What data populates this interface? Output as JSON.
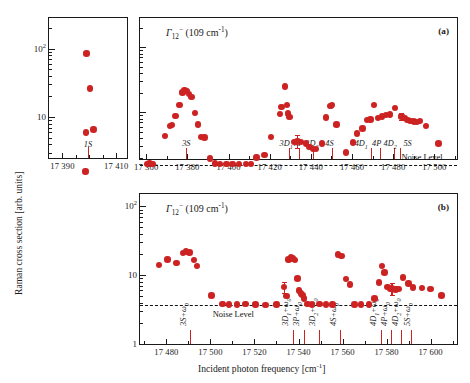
{
  "figure": {
    "y_axis_title": "Raman cross section  [arb. units]",
    "x_axis_title": "Incident photon frequency   [cm",
    "x_axis_title_sup": "-1",
    "x_axis_title_tail": "]",
    "noise_label": "Noise Level",
    "gamma_label_main": "Γ",
    "gamma_label_sub": "12",
    "gamma_label_sup": "−",
    "gamma_label_tail": " (109 cm",
    "gamma_label_tail_sup": "-1",
    "gamma_label_tail_end": ")"
  },
  "inset": {
    "name": "inset-1s-panel",
    "x_ticks_major": [
      17390,
      17410
    ],
    "x_ticks_major_labels": [
      "17 390",
      "17 410"
    ],
    "x_ticks_minor": [
      17395,
      17400,
      17405
    ],
    "xlim": [
      17385,
      17414
    ],
    "ylim_decades": [
      0.4,
      2.45
    ],
    "y_ticks_major": [
      1,
      10,
      100
    ],
    "y_ticks_major_labels": [
      "1",
      "10",
      "10"
    ],
    "y_tick_sup": "2",
    "state_label": "1S",
    "state_line_x": 17399.5,
    "points": [
      {
        "x": 17399.0,
        "y": 85.0
      },
      {
        "x": 17400.3,
        "y": 26.0
      },
      {
        "x": 17398.8,
        "y": 5.9
      },
      {
        "x": 17401.6,
        "y": 6.6
      },
      {
        "x": 17398.5,
        "y": 1.6
      }
    ]
  },
  "panel_a": {
    "name": "panel-a",
    "tag": "(a)",
    "xlim": [
      17357,
      17511
    ],
    "ylim_decades": [
      0.28,
      2.45
    ],
    "x_ticks_major": [
      17360,
      17380,
      17400,
      17420,
      17440,
      17460,
      17480,
      17500
    ],
    "x_ticks_major_labels": [
      "17 360",
      "17 380",
      "17 400",
      "17 420",
      "17 440",
      "17 460",
      "17 480",
      "17 500"
    ],
    "x_ticks_minor": [
      17370,
      17390,
      17410,
      17430,
      17450,
      17470,
      17490,
      17510
    ],
    "noise_level": 1.55,
    "state_labels": [
      {
        "text": "3S",
        "label_x": 17379.5,
        "line_x": 17379.5
      },
      {
        "text": "3D1",
        "base": "3D",
        "sub": "1",
        "label_x": 17428.0,
        "line_x": 17429.2
      },
      {
        "text": "3P",
        "base": "3P",
        "sub": "",
        "label_x": 17434.0,
        "line_x": 17434.3
      },
      {
        "text": "3D2",
        "base": "3D",
        "sub": "2",
        "label_x": 17440.5,
        "line_x": 17441.0
      },
      {
        "text": "4S",
        "base": "4S",
        "sub": "",
        "label_x": 17449.0,
        "line_x": 17450.5
      },
      {
        "text": "4D1",
        "base": "4D",
        "sub": "1",
        "label_x": 17464.5,
        "line_x": 17469.3
      },
      {
        "text": "4P",
        "base": "4P",
        "sub": "",
        "label_x": 17472.0,
        "line_x": 17473.5
      },
      {
        "text": "4D2",
        "base": "4D",
        "sub": "2",
        "label_x": 17478.5,
        "line_x": 17480.2
      },
      {
        "text": "5S",
        "base": "5S",
        "sub": "",
        "label_x": 17487.0,
        "line_x": 17483.5
      }
    ],
    "points": [
      {
        "x": 17360.3,
        "y": 1.6
      },
      {
        "x": 17361.6,
        "y": 1.62
      },
      {
        "x": 17363.0,
        "y": 1.6
      },
      {
        "x": 17369.2,
        "y": 4.3
      },
      {
        "x": 17371.5,
        "y": 6.1
      },
      {
        "x": 17372.6,
        "y": 6.3
      },
      {
        "x": 17374.2,
        "y": 8.8
      },
      {
        "x": 17376.2,
        "y": 13.0
      },
      {
        "x": 17377.6,
        "y": 20.0
      },
      {
        "x": 17378.7,
        "y": 21.5
      },
      {
        "x": 17379.8,
        "y": 21.0
      },
      {
        "x": 17380.9,
        "y": 19.0
      },
      {
        "x": 17382.0,
        "y": 17.0
      },
      {
        "x": 17383.6,
        "y": 9.8
      },
      {
        "x": 17385.2,
        "y": 6.5
      },
      {
        "x": 17386.6,
        "y": 4.2
      },
      {
        "x": 17388.3,
        "y": 4.1
      },
      {
        "x": 17391.0,
        "y": 1.95
      },
      {
        "x": 17393.5,
        "y": 1.62
      },
      {
        "x": 17396.0,
        "y": 1.58
      },
      {
        "x": 17399.0,
        "y": 1.6
      },
      {
        "x": 17402.0,
        "y": 1.6
      },
      {
        "x": 17405.0,
        "y": 1.6
      },
      {
        "x": 17408.5,
        "y": 1.58
      },
      {
        "x": 17411.0,
        "y": 1.6
      },
      {
        "x": 17413.5,
        "y": 2.0
      },
      {
        "x": 17417.5,
        "y": 2.2
      },
      {
        "x": 17420.5,
        "y": 4.2
      },
      {
        "x": 17425.0,
        "y": 9.3
      },
      {
        "x": 17425.8,
        "y": 12.0
      },
      {
        "x": 17427.3,
        "y": 25.0
      },
      {
        "x": 17428.3,
        "y": 13.0
      },
      {
        "x": 17428.9,
        "y": 9.5
      },
      {
        "x": 17429.7,
        "y": 8.4
      },
      {
        "x": 17432.0,
        "y": 3.5
      },
      {
        "x": 17433.5,
        "y": 3.55
      },
      {
        "x": 17435.2,
        "y": 3.5
      },
      {
        "x": 17437.5,
        "y": 3.3
      },
      {
        "x": 17439.3,
        "y": 2.9
      },
      {
        "x": 17441.0,
        "y": 2.7
      },
      {
        "x": 17442.6,
        "y": 2.7
      },
      {
        "x": 17445.5,
        "y": 3.3
      },
      {
        "x": 17447.5,
        "y": 8.3
      },
      {
        "x": 17449.5,
        "y": 12.5
      },
      {
        "x": 17450.4,
        "y": 13.0
      },
      {
        "x": 17452.5,
        "y": 6.5
      },
      {
        "x": 17457.0,
        "y": 2.4
      },
      {
        "x": 17460.5,
        "y": 3.4
      },
      {
        "x": 17462.5,
        "y": 4.7
      },
      {
        "x": 17465.0,
        "y": 5.6
      },
      {
        "x": 17467.3,
        "y": 7.6
      },
      {
        "x": 17469.0,
        "y": 7.7
      },
      {
        "x": 17470.8,
        "y": 13.0
      },
      {
        "x": 17472.5,
        "y": 8.2
      },
      {
        "x": 17474.5,
        "y": 8.6
      },
      {
        "x": 17476.5,
        "y": 9.0
      },
      {
        "x": 17478.5,
        "y": 9.2
      },
      {
        "x": 17481.0,
        "y": 11.5
      },
      {
        "x": 17484.0,
        "y": 8.6
      },
      {
        "x": 17485.5,
        "y": 8.2
      },
      {
        "x": 17487.0,
        "y": 7.6
      },
      {
        "x": 17488.5,
        "y": 7.3
      },
      {
        "x": 17490.0,
        "y": 7.2
      },
      {
        "x": 17491.5,
        "y": 7.1
      },
      {
        "x": 17493.0,
        "y": 7.3
      },
      {
        "x": 17496.0,
        "y": 6.1
      },
      {
        "x": 17502.0,
        "y": 3.3
      }
    ],
    "error_points": [
      {
        "x": 17433.5,
        "y": 3.55,
        "lo": 2.85,
        "hi": 4.45
      },
      {
        "x": 17484.0,
        "y": 8.6,
        "lo": 7.6,
        "hi": 9.8
      }
    ]
  },
  "panel_b": {
    "name": "panel-b",
    "tag": "(b)",
    "xlim": [
      17468,
      17612
    ],
    "ylim_decades": [
      0.0,
      2.18
    ],
    "x_ticks_major": [
      17480,
      17500,
      17520,
      17540,
      17560,
      17580,
      17600
    ],
    "x_ticks_major_labels": [
      "17 480",
      "17 500",
      "17 520",
      "17 540",
      "17 560",
      "17 580",
      "17 600"
    ],
    "x_ticks_minor": [
      17470,
      17490,
      17510,
      17530,
      17550,
      17570,
      17590,
      17610
    ],
    "y_ticks_major": [
      1,
      10,
      100
    ],
    "y_ticks_major_labels": [
      "1",
      "10",
      "10"
    ],
    "y_tick_sup": "2",
    "noise_level": 3.7,
    "state_labels": [
      {
        "base": "3S",
        "sub": "",
        "suffix": "+ω",
        "suffix_sub": "0",
        "label_x": 17490.0,
        "line_x": 17490.5
      },
      {
        "base": "3D",
        "sub": "1",
        "suffix": "+ω",
        "suffix_sub": "0",
        "label_x": 17536.0,
        "line_x": 17537.5
      },
      {
        "base": "3P",
        "sub": "",
        "suffix": "+ω",
        "suffix_sub": "0",
        "label_x": 17541.0,
        "line_x": 17542.5
      },
      {
        "base": "3D",
        "sub": "2",
        "suffix": "+ω",
        "suffix_sub": "0",
        "label_x": 17548.5,
        "line_x": 17549.5
      },
      {
        "base": "4S",
        "sub": "",
        "suffix": "+ω",
        "suffix_sub": "0",
        "label_x": 17558.0,
        "line_x": 17559.0
      },
      {
        "base": "4D",
        "sub": "1",
        "suffix": "+ω",
        "suffix_sub": "0",
        "label_x": 17576.0,
        "line_x": 17577.5
      },
      {
        "base": "4P",
        "sub": "",
        "suffix": "+ω",
        "suffix_sub": "0",
        "label_x": 17581.0,
        "line_x": 17581.8
      },
      {
        "base": "4D",
        "sub": "2",
        "suffix": "+ω",
        "suffix_sub": "0",
        "label_x": 17586.0,
        "line_x": 17586.5
      },
      {
        "base": "5S",
        "sub": "",
        "suffix": "+ω",
        "suffix_sub": "0",
        "label_x": 17591.5,
        "line_x": 17591.0
      }
    ],
    "points": [
      {
        "x": 17476.5,
        "y": 14.0
      },
      {
        "x": 17480.5,
        "y": 17.0
      },
      {
        "x": 17484.5,
        "y": 15.0
      },
      {
        "x": 17487.5,
        "y": 21.0
      },
      {
        "x": 17489.0,
        "y": 22.0
      },
      {
        "x": 17490.5,
        "y": 21.5
      },
      {
        "x": 17492.5,
        "y": 16.5
      },
      {
        "x": 17494.0,
        "y": 13.5
      },
      {
        "x": 17500.5,
        "y": 5.1
      },
      {
        "x": 17505.5,
        "y": 3.8
      },
      {
        "x": 17508.5,
        "y": 3.75
      },
      {
        "x": 17512.0,
        "y": 3.75
      },
      {
        "x": 17516.0,
        "y": 3.8
      },
      {
        "x": 17520.5,
        "y": 3.75
      },
      {
        "x": 17525.0,
        "y": 3.7
      },
      {
        "x": 17530.0,
        "y": 3.75
      },
      {
        "x": 17533.5,
        "y": 6.7
      },
      {
        "x": 17534.5,
        "y": 5.0
      },
      {
        "x": 17535.5,
        "y": 17.0
      },
      {
        "x": 17536.5,
        "y": 18.5
      },
      {
        "x": 17537.3,
        "y": 17.5
      },
      {
        "x": 17538.5,
        "y": 16.5
      },
      {
        "x": 17539.5,
        "y": 9.0
      },
      {
        "x": 17540.3,
        "y": 6.0
      },
      {
        "x": 17541.0,
        "y": 5.4
      },
      {
        "x": 17541.8,
        "y": 5.2
      },
      {
        "x": 17542.6,
        "y": 4.6
      },
      {
        "x": 17544.0,
        "y": 3.85
      },
      {
        "x": 17546.0,
        "y": 3.75
      },
      {
        "x": 17549.5,
        "y": 3.8
      },
      {
        "x": 17552.5,
        "y": 3.75
      },
      {
        "x": 17555.5,
        "y": 3.75
      },
      {
        "x": 17558.0,
        "y": 20.0
      },
      {
        "x": 17559.5,
        "y": 19.0
      },
      {
        "x": 17561.5,
        "y": 8.8
      },
      {
        "x": 17563.5,
        "y": 7.3
      },
      {
        "x": 17565.5,
        "y": 3.75
      },
      {
        "x": 17568.5,
        "y": 3.75
      },
      {
        "x": 17572.0,
        "y": 3.75
      },
      {
        "x": 17574.5,
        "y": 4.6
      },
      {
        "x": 17576.5,
        "y": 7.8
      },
      {
        "x": 17578.0,
        "y": 13.5
      },
      {
        "x": 17579.0,
        "y": 11.0
      },
      {
        "x": 17580.5,
        "y": 6.7
      },
      {
        "x": 17581.5,
        "y": 6.3
      },
      {
        "x": 17582.5,
        "y": 6.4
      },
      {
        "x": 17584.0,
        "y": 6.2
      },
      {
        "x": 17585.5,
        "y": 6.3
      },
      {
        "x": 17587.5,
        "y": 9.2
      },
      {
        "x": 17590.0,
        "y": 7.6
      },
      {
        "x": 17592.0,
        "y": 6.6
      },
      {
        "x": 17596.0,
        "y": 6.5
      },
      {
        "x": 17600.0,
        "y": 6.3
      },
      {
        "x": 17605.0,
        "y": 5.1
      }
    ],
    "error_points": [
      {
        "x": 17533.5,
        "y": 6.7,
        "lo": 5.6,
        "hi": 7.9
      },
      {
        "x": 17582.5,
        "y": 6.4,
        "lo": 5.2,
        "hi": 7.8
      }
    ]
  }
}
